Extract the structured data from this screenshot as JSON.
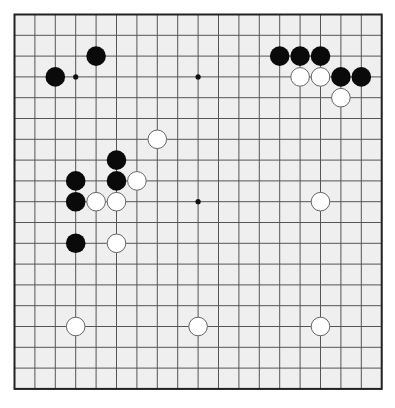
{
  "board": {
    "size": 19,
    "colors": {
      "board_bg": "#efefef",
      "line": "#555555",
      "border": "#222222",
      "black_stone": "#0a0a0a",
      "white_stone": "#ffffff",
      "white_outline": "#666666",
      "star_point": "#111111"
    },
    "star_points_visible": [
      {
        "col": 3,
        "row": 3
      },
      {
        "col": 9,
        "row": 3
      },
      {
        "col": 9,
        "row": 9
      }
    ],
    "stones": [
      {
        "color": "black",
        "col": 4,
        "row": 2
      },
      {
        "color": "black",
        "col": 2,
        "row": 3
      },
      {
        "color": "black",
        "col": 13,
        "row": 2
      },
      {
        "color": "black",
        "col": 14,
        "row": 2
      },
      {
        "color": "black",
        "col": 15,
        "row": 2
      },
      {
        "color": "white",
        "col": 14,
        "row": 3
      },
      {
        "color": "white",
        "col": 15,
        "row": 3
      },
      {
        "color": "black",
        "col": 16,
        "row": 3
      },
      {
        "color": "black",
        "col": 17,
        "row": 3
      },
      {
        "color": "white",
        "col": 16,
        "row": 4
      },
      {
        "color": "white",
        "col": 7,
        "row": 6
      },
      {
        "color": "black",
        "col": 5,
        "row": 7
      },
      {
        "color": "black",
        "col": 3,
        "row": 8
      },
      {
        "color": "black",
        "col": 5,
        "row": 8
      },
      {
        "color": "white",
        "col": 6,
        "row": 8
      },
      {
        "color": "black",
        "col": 3,
        "row": 9
      },
      {
        "color": "white",
        "col": 4,
        "row": 9
      },
      {
        "color": "white",
        "col": 5,
        "row": 9
      },
      {
        "color": "white",
        "col": 15,
        "row": 9
      },
      {
        "color": "black",
        "col": 3,
        "row": 11
      },
      {
        "color": "white",
        "col": 5,
        "row": 11
      },
      {
        "color": "white",
        "col": 3,
        "row": 15
      },
      {
        "color": "white",
        "col": 9,
        "row": 15
      },
      {
        "color": "white",
        "col": 15,
        "row": 15
      }
    ]
  }
}
